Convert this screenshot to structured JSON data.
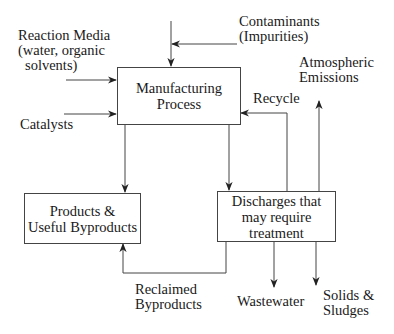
{
  "diagram": {
    "boxes": {
      "manufacturing": {
        "line1": "Manufacturing",
        "line2": "Process"
      },
      "products": {
        "line1": "Products &",
        "line2": "Useful Byproducts"
      },
      "discharges": {
        "line1": "Discharges that",
        "line2": "may require",
        "line3": "treatment"
      }
    },
    "labels": {
      "reaction_media": {
        "line1": "Reaction Media",
        "line2": "(water, organic",
        "line3": "solvents)"
      },
      "catalysts": "Catalysts",
      "contaminants": {
        "line1": "Contaminants",
        "line2": "(Impurities)"
      },
      "atmospheric": {
        "line1": "Atmospheric",
        "line2": "Emissions"
      },
      "recycle": "Recycle",
      "reclaimed": {
        "line1": "Reclaimed",
        "line2": "Byproducts"
      },
      "wastewater": "Wastewater",
      "solids": {
        "line1": "Solids &",
        "line2": "Sludges"
      }
    }
  }
}
